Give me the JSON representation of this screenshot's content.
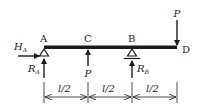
{
  "diagram": {
    "type": "beam-free-body",
    "points": {
      "A": "A",
      "B": "B",
      "C": "C",
      "D": "D"
    },
    "forces": {
      "HA_main": "H",
      "HA_sub": "A",
      "RA_main": "R",
      "RA_sub": "A",
      "RB_main": "R",
      "RB_sub": "B",
      "P_C": "P",
      "P_D": "P"
    },
    "dimensions": [
      {
        "label": "l/2"
      },
      {
        "label": "l/2"
      },
      {
        "label": "l/2"
      }
    ],
    "colors": {
      "ink": "#1a1a1a",
      "background": "#ffffff"
    }
  }
}
